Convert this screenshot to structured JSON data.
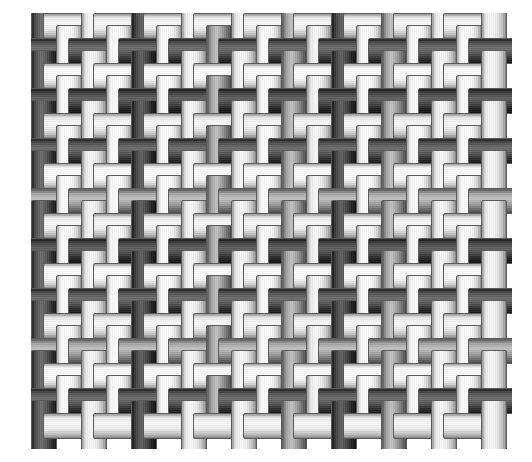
{
  "figure": {
    "kind": "plain-weave-simulation",
    "background_color": "#ffffff"
  },
  "weave": {
    "structure": "plain weave (1/1 tabby)",
    "columns": 19,
    "rows": 17,
    "cell_pitch_px": 25,
    "thread_width_px": 26,
    "overshoot_px": 13,
    "grid_left_px": 31,
    "grid_top_px": 13,
    "grid_width_px": 481,
    "grid_height_px": 436,
    "outline_color": "#5a5a5a",
    "shade_palette": {
      "white": "#f7f7f7",
      "light": "#e2e2e2",
      "mid": "#8d8d8d",
      "dark": "#3a3a3a",
      "darker": "#2a2a2a"
    },
    "warp_shades": [
      "dark",
      "white",
      "light",
      "white",
      "darker",
      "white",
      "light",
      "mid",
      "light",
      "white",
      "mid",
      "light",
      "darker",
      "white",
      "mid",
      "white",
      "light",
      "white",
      "light"
    ],
    "weft_shades": [
      "light",
      "dark",
      "white",
      "darker",
      "light",
      "dark",
      "white",
      "mid",
      "light",
      "darker",
      "white",
      "dark",
      "light",
      "mid",
      "white",
      "dark",
      "light"
    ],
    "interlacing_note": "warp passes over weft when (row + column) is even"
  }
}
